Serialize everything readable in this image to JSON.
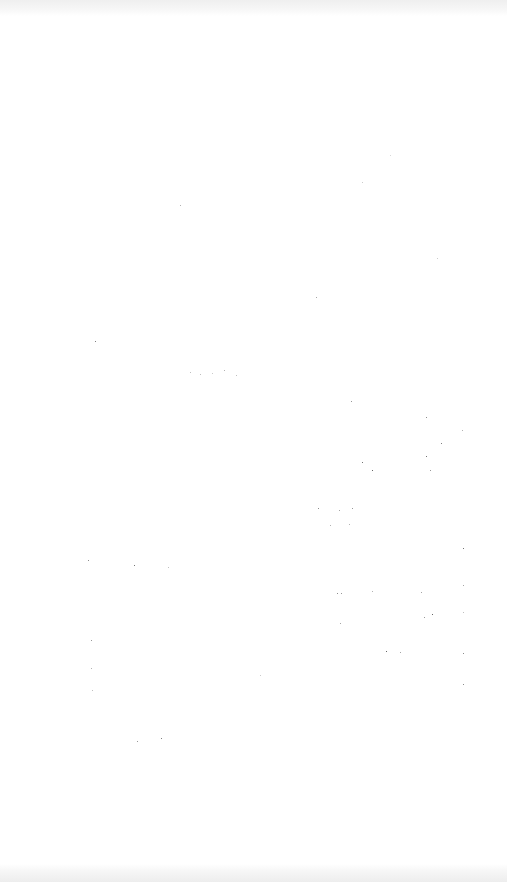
{
  "screen": {
    "background_color": "#ffffff",
    "status_bar_band_color": "#efefef",
    "nav_bar_band_color": "#ededed",
    "state": "blank"
  },
  "noise_dots": [
    {
      "x": 95,
      "y": 341,
      "c": "#555555"
    },
    {
      "x": 180,
      "y": 205,
      "c": "#999999"
    },
    {
      "x": 190,
      "y": 372,
      "c": "#aaaaaa"
    },
    {
      "x": 200,
      "y": 374,
      "c": "#aaaaaa"
    },
    {
      "x": 212,
      "y": 373,
      "c": "#bbbbbb"
    },
    {
      "x": 224,
      "y": 370,
      "c": "#999999"
    },
    {
      "x": 236,
      "y": 375,
      "c": "#aaaaaa"
    },
    {
      "x": 316,
      "y": 297,
      "c": "#888888"
    },
    {
      "x": 362,
      "y": 182,
      "c": "#bbbbbb"
    },
    {
      "x": 390,
      "y": 155,
      "c": "#cccccc"
    },
    {
      "x": 437,
      "y": 258,
      "c": "#bbbbbb"
    },
    {
      "x": 351,
      "y": 401,
      "c": "#777777"
    },
    {
      "x": 426,
      "y": 417,
      "c": "#666666"
    },
    {
      "x": 462,
      "y": 430,
      "c": "#999999"
    },
    {
      "x": 441,
      "y": 443,
      "c": "#555555"
    },
    {
      "x": 362,
      "y": 462,
      "c": "#444444"
    },
    {
      "x": 372,
      "y": 470,
      "c": "#333333"
    },
    {
      "x": 426,
      "y": 456,
      "c": "#444444"
    },
    {
      "x": 430,
      "y": 470,
      "c": "#777777"
    },
    {
      "x": 318,
      "y": 508,
      "c": "#666666"
    },
    {
      "x": 339,
      "y": 510,
      "c": "#888888"
    },
    {
      "x": 352,
      "y": 508,
      "c": "#777777"
    },
    {
      "x": 330,
      "y": 525,
      "c": "#999999"
    },
    {
      "x": 349,
      "y": 524,
      "c": "#999999"
    },
    {
      "x": 463,
      "y": 548,
      "c": "#444444"
    },
    {
      "x": 88,
      "y": 560,
      "c": "#666666"
    },
    {
      "x": 134,
      "y": 565,
      "c": "#444444"
    },
    {
      "x": 168,
      "y": 567,
      "c": "#aaaaaa"
    },
    {
      "x": 337,
      "y": 593,
      "c": "#666666"
    },
    {
      "x": 341,
      "y": 593,
      "c": "#777777"
    },
    {
      "x": 372,
      "y": 591,
      "c": "#999999"
    },
    {
      "x": 421,
      "y": 592,
      "c": "#888888"
    },
    {
      "x": 463,
      "y": 585,
      "c": "#888888"
    },
    {
      "x": 432,
      "y": 614,
      "c": "#333333"
    },
    {
      "x": 424,
      "y": 617,
      "c": "#777777"
    },
    {
      "x": 463,
      "y": 612,
      "c": "#aaaaaa"
    },
    {
      "x": 340,
      "y": 623,
      "c": "#888888"
    },
    {
      "x": 91,
      "y": 640,
      "c": "#777777"
    },
    {
      "x": 386,
      "y": 651,
      "c": "#333333"
    },
    {
      "x": 400,
      "y": 652,
      "c": "#888888"
    },
    {
      "x": 463,
      "y": 653,
      "c": "#666666"
    },
    {
      "x": 91,
      "y": 668,
      "c": "#999999"
    },
    {
      "x": 260,
      "y": 675,
      "c": "#bbbbbb"
    },
    {
      "x": 92,
      "y": 690,
      "c": "#aaaaaa"
    },
    {
      "x": 463,
      "y": 684,
      "c": "#666666"
    },
    {
      "x": 137,
      "y": 741,
      "c": "#777777"
    },
    {
      "x": 161,
      "y": 738,
      "c": "#555555"
    }
  ]
}
